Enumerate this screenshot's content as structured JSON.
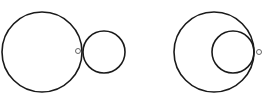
{
  "diagram": {
    "stroke_color": "#1a1a1a",
    "marker_color": "#555555",
    "figures": [
      {
        "name": "externally-tangent-circles",
        "large_circle": {
          "cx": 42,
          "cy": 52,
          "r": 40
        },
        "small_circle": {
          "cx": 104,
          "cy": 52,
          "r": 21
        },
        "marker": {
          "cx": 78,
          "cy": 51,
          "r": 2.5
        }
      },
      {
        "name": "internally-tangent-circles",
        "large_circle": {
          "cx": 214,
          "cy": 52,
          "r": 40
        },
        "small_circle": {
          "cx": 233,
          "cy": 52,
          "r": 21
        },
        "marker": {
          "cx": 259,
          "cy": 52,
          "r": 2.5
        }
      }
    ]
  }
}
